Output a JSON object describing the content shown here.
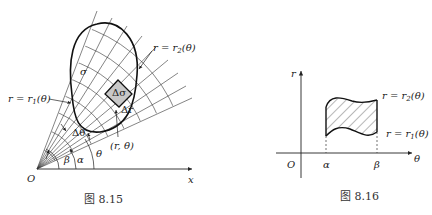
{
  "figure_815": {
    "caption": "图 8.15",
    "origin_label": "O",
    "x_axis_label": "x",
    "region_label": "σ",
    "element_label": "Δσ",
    "delta_r_label": "Δr",
    "delta_theta_label": "Δθ",
    "point_label": "(r, θ)",
    "theta_label": "θ",
    "alpha_label": "α",
    "beta_label": "β",
    "outer_curve_label": {
      "lhs": "r = r",
      "sub": "2",
      "rhs": "(θ)"
    },
    "inner_curve_label": {
      "lhs": "r = r",
      "sub": "1",
      "rhs": "(θ)"
    },
    "element_fill": "#c8c8c8"
  },
  "figure_816": {
    "caption": "图 8.16",
    "origin_label": "O",
    "r_axis_label": "r",
    "theta_axis_label": "θ",
    "alpha_label": "α",
    "beta_label": "β",
    "upper_curve_label": {
      "lhs": "r = r",
      "sub": "2",
      "rhs": "(θ)"
    },
    "lower_curve_label": {
      "lhs": "r = r",
      "sub": "1",
      "rhs": "(θ)"
    }
  }
}
